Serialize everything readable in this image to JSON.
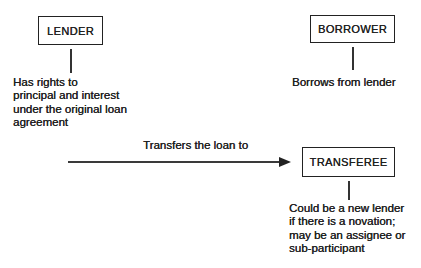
{
  "canvas": {
    "background": "#ffffff",
    "ink": "#1f1f1f",
    "line_color": "#333333"
  },
  "nodes": {
    "lender": {
      "label": "LENDER",
      "note": "Has rights to\nprincipal and interest\nunder the original loan\nagreement"
    },
    "borrower": {
      "label": "BORROWER",
      "note": "Borrows from lender"
    },
    "transferee": {
      "label": "TRANSFEREE",
      "note": "Could be a new lender\nif there is a novation;\nmay be an assignee or\nsub-participant"
    }
  },
  "edges": {
    "transfer": {
      "from": "LENDER",
      "to": "TRANSFEREE",
      "label": "Transfers the loan to"
    }
  }
}
